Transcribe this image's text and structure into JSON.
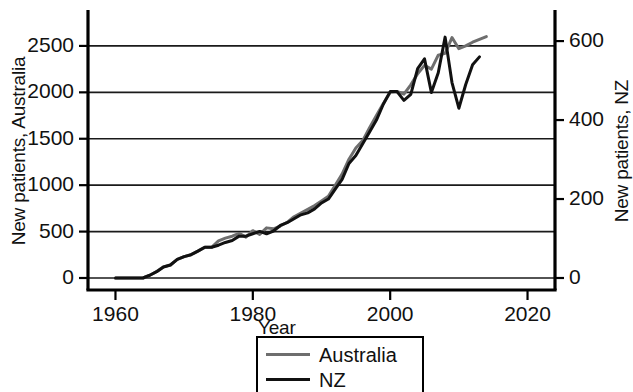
{
  "chart_data": {
    "type": "line",
    "title": "",
    "xlabel": "Year",
    "ylabel": "New patients, Australia",
    "ylabel_right": "New patients, NZ",
    "xlim": [
      1956,
      2024
    ],
    "ylim": [
      0,
      2650
    ],
    "ylim_right": [
      0,
      623
    ],
    "xticks": [
      1960,
      1980,
      2000,
      2020
    ],
    "yticks_left": [
      0,
      500,
      1000,
      1500,
      2000,
      2500
    ],
    "yticks_right": [
      0,
      200,
      400,
      600
    ],
    "grid": "horizontal",
    "legend_position": "bottom-center",
    "series": [
      {
        "name": "Australia",
        "color": "#6e6e6e",
        "axis": "left",
        "x": [
          1960,
          1962,
          1964,
          1965,
          1966,
          1967,
          1968,
          1969,
          1970,
          1971,
          1972,
          1973,
          1974,
          1975,
          1976,
          1977,
          1978,
          1979,
          1980,
          1981,
          1982,
          1983,
          1984,
          1985,
          1986,
          1987,
          1988,
          1989,
          1990,
          1991,
          1992,
          1993,
          1994,
          1995,
          1996,
          1997,
          1998,
          1999,
          2000,
          2001,
          2002,
          2003,
          2004,
          2005,
          2006,
          2007,
          2008,
          2009,
          2010,
          2011,
          2012,
          2013,
          2014
        ],
        "values": [
          0,
          0,
          0,
          30,
          70,
          120,
          140,
          200,
          230,
          250,
          290,
          330,
          330,
          400,
          430,
          450,
          480,
          440,
          510,
          470,
          540,
          530,
          560,
          600,
          660,
          700,
          740,
          780,
          830,
          880,
          1000,
          1120,
          1280,
          1400,
          1480,
          1620,
          1750,
          1880,
          2000,
          2010,
          1980,
          2080,
          2200,
          2290,
          2250,
          2400,
          2420,
          2590,
          2470,
          2500,
          2540,
          2570,
          2600
        ]
      },
      {
        "name": "NZ",
        "color": "#111111",
        "axis": "right",
        "x": [
          1960,
          1962,
          1964,
          1965,
          1966,
          1967,
          1968,
          1969,
          1970,
          1971,
          1972,
          1973,
          1974,
          1975,
          1976,
          1977,
          1978,
          1979,
          1980,
          1981,
          1982,
          1983,
          1984,
          1985,
          1986,
          1987,
          1988,
          1989,
          1990,
          1991,
          1992,
          1993,
          1994,
          1995,
          1996,
          1997,
          1998,
          1999,
          2000,
          2001,
          2002,
          2003,
          2004,
          2005,
          2006,
          2007,
          2008,
          2009,
          2010,
          2011,
          2012,
          2013
        ],
        "values": [
          0,
          0,
          0,
          7,
          16,
          28,
          33,
          47,
          54,
          59,
          68,
          78,
          78,
          83,
          90,
          95,
          106,
          106,
          112,
          118,
          112,
          119,
          133,
          140,
          150,
          160,
          165,
          175,
          190,
          200,
          225,
          250,
          290,
          310,
          340,
          370,
          400,
          440,
          472,
          472,
          450,
          465,
          530,
          555,
          470,
          520,
          610,
          495,
          430,
          490,
          540,
          560
        ]
      }
    ]
  },
  "legend": {
    "items": [
      {
        "label": "Australia",
        "color": "#6e6e6e"
      },
      {
        "label": "NZ",
        "color": "#111111"
      }
    ]
  }
}
